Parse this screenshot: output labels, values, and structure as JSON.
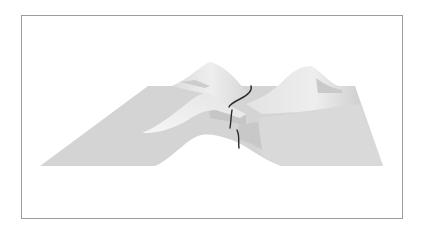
{
  "figure": {
    "type": "3d-surface-rendering",
    "description": "Two-peaked mountain surface with a saddle between peaks and a dark path curve crossing the saddle",
    "colors": {
      "background": "#ffffff",
      "frame": "#9c9c9c",
      "surface_light": "#e6e6e6",
      "surface_mid": "#d2d2d2",
      "surface_shadow": "#c4c4c4",
      "highlight": "#f4f4f4",
      "path": "#2a2a2a"
    },
    "elements": {
      "left_peak": "left-peak",
      "right_peak": "right-peak",
      "saddle": "saddle",
      "path_curve": "path-curve"
    }
  }
}
